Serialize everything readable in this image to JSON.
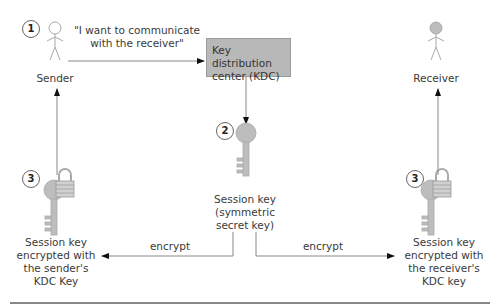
{
  "diagram": {
    "colors": {
      "figure": "#bdbdbd",
      "kdc_fill": "#b8b8b8",
      "line": "#888888",
      "arrow": "#111111"
    },
    "steps": [
      {
        "number": "1"
      },
      {
        "number": "2"
      },
      {
        "number": "3"
      },
      {
        "number": "3"
      }
    ],
    "nodes": {
      "sender": {
        "label": "Sender",
        "icon": "person-outline-icon"
      },
      "receiver": {
        "label": "Receiver",
        "icon": "person-filled-icon"
      },
      "kdc": {
        "label_line1": "Key distribution",
        "label_line2": "center (KDC)"
      },
      "session_key": {
        "line1": "Session key",
        "line2": "(symmetric",
        "line3": "secret key)",
        "icon": "key-icon"
      },
      "sender_key": {
        "line1": "Session key",
        "line2": "encrypted with",
        "line3": "the sender's",
        "line4": "KDC Key",
        "icon": "locked-key-icon"
      },
      "receiver_key": {
        "line1": "Session key",
        "line2": "encrypted with",
        "line3": "the receiver's",
        "line4": "KDC key",
        "icon": "locked-key-icon"
      }
    },
    "edges": {
      "request": {
        "line1": "\"I want to communicate",
        "line2": "with the receiver\""
      },
      "encrypt_left": {
        "label": "encrypt"
      },
      "encrypt_right": {
        "label": "encrypt"
      }
    }
  }
}
